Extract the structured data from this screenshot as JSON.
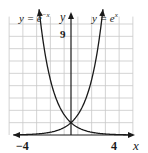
{
  "chart_data": {
    "type": "line",
    "title": "",
    "series": [
      {
        "name": "y = e^{-x}",
        "label": "y = e",
        "exp": "−x",
        "function": "exp(-x)"
      },
      {
        "name": "y = e^{x}",
        "label": "y = e",
        "exp": "x",
        "function": "exp(x)"
      }
    ],
    "xlabel": "x",
    "ylabel": "y",
    "xlim": [
      -4,
      4
    ],
    "ylim": [
      0,
      9
    ],
    "x_ticks_labeled": [
      "−4",
      "4"
    ],
    "y_ticks_labeled": [
      "9"
    ],
    "grid": true,
    "grid_x_step": 1,
    "grid_y_step": 1,
    "intersection": [
      0,
      1
    ]
  },
  "labels": {
    "left_curve": "y = e",
    "left_exp": "−x",
    "right_curve": "y = e",
    "right_exp": "x",
    "y_axis": "y",
    "x_axis": "x",
    "y_tick_9": "9",
    "x_tick_neg4": "−4",
    "x_tick_4": "4"
  },
  "colors": {
    "grid": "#c8c8c8",
    "curve": "#1a1a1a",
    "axis": "#1a1a1a"
  }
}
